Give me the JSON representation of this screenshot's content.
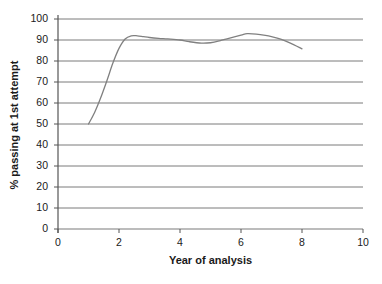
{
  "chart_data": {
    "type": "line",
    "title": "",
    "xlabel": "Year of analysis",
    "ylabel": "% passing at 1st attempt",
    "xlim": [
      0,
      10
    ],
    "ylim": [
      0,
      100
    ],
    "xticks": [
      0,
      2,
      4,
      6,
      8,
      10
    ],
    "yticks": [
      0,
      10,
      20,
      30,
      40,
      50,
      60,
      70,
      80,
      90,
      100
    ],
    "xtick_labels": [
      "0",
      "2",
      "4",
      "6",
      "8",
      "10"
    ],
    "ytick_labels": [
      "0",
      "10",
      "20",
      "30",
      "40",
      "50",
      "60",
      "70",
      "80",
      "90",
      "100"
    ],
    "grid": "horizontal",
    "legend": "none",
    "series": [
      {
        "name": "% passing at 1st attempt",
        "color": "#808080",
        "x": [
          1.0,
          1.2,
          1.4,
          1.6,
          1.8,
          2.0,
          2.2,
          2.4,
          2.6,
          2.8,
          3.0,
          3.3,
          3.6,
          4.0,
          4.3,
          4.7,
          5.0,
          5.3,
          5.6,
          6.0,
          6.2,
          6.5,
          6.8,
          7.0,
          7.3,
          7.6,
          8.0
        ],
        "y": [
          50.0,
          55.5,
          62.5,
          70.5,
          79.0,
          86.0,
          90.5,
          92.0,
          92.0,
          91.6,
          91.2,
          90.8,
          90.5,
          90.0,
          89.2,
          88.5,
          88.7,
          89.6,
          90.8,
          92.3,
          93.0,
          92.8,
          92.2,
          91.6,
          90.4,
          88.6,
          85.8
        ]
      }
    ]
  },
  "axis": {
    "y_title": "% passing at 1st attempt",
    "x_title": "Year of analysis"
  },
  "colors": {
    "line": "#808080",
    "grid": "#7a7a7a",
    "axis": "#555555",
    "text": "#1a1a1a",
    "background": "#ffffff"
  }
}
